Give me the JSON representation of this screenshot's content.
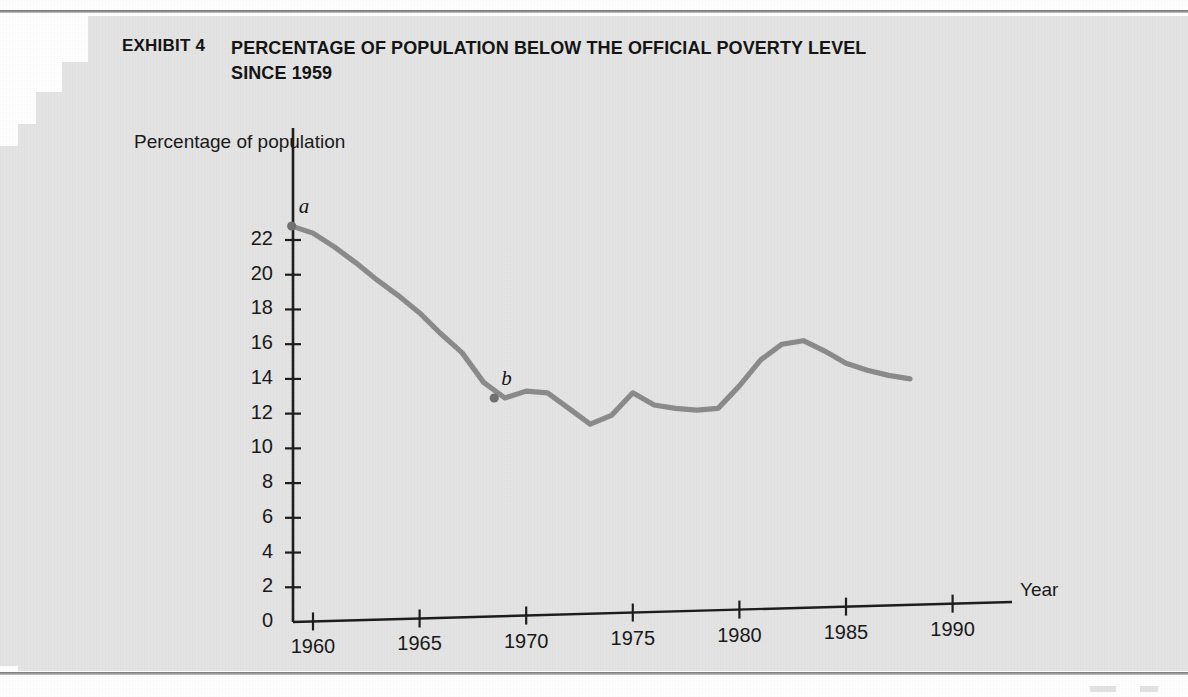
{
  "document": {
    "exhibit_label": "EXHIBIT 4",
    "title": "PERCENTAGE OF POPULATION BELOW THE OFFICIAL POVERTY LEVEL SINCE 1959"
  },
  "colors": {
    "paper": "#e4e4e4",
    "ink": "#111111",
    "axis": "#1a1a1a",
    "series_line": "#8a8a8a",
    "marker": "#6f6f6f"
  },
  "chart_data": {
    "type": "line",
    "title": "PERCENTAGE OF POPULATION BELOW THE OFFICIAL POVERTY LEVEL SINCE 1959",
    "xlabel": "Year",
    "ylabel": "Percentage of population",
    "xlim": [
      1958,
      1992
    ],
    "ylim": [
      0,
      23.5
    ],
    "grid": false,
    "legend": null,
    "xticks": [
      1960,
      1965,
      1970,
      1975,
      1980,
      1985,
      1990
    ],
    "yticks": [
      0,
      2,
      4,
      6,
      8,
      10,
      12,
      14,
      16,
      18,
      20,
      22
    ],
    "series": [
      {
        "name": "Percentage of population below official poverty level",
        "x": [
          1959,
          1960,
          1961,
          1962,
          1963,
          1964,
          1965,
          1966,
          1967,
          1968,
          1969,
          1970,
          1971,
          1972,
          1973,
          1974,
          1975,
          1976,
          1977,
          1978,
          1979,
          1980,
          1981,
          1982,
          1983,
          1984,
          1985,
          1986,
          1987,
          1988
        ],
        "values": [
          22.8,
          22.4,
          21.6,
          20.7,
          19.7,
          18.8,
          17.8,
          16.6,
          15.5,
          13.8,
          12.9,
          13.3,
          13.2,
          12.3,
          11.4,
          11.9,
          13.2,
          12.5,
          12.3,
          12.2,
          12.3,
          13.6,
          15.1,
          16.0,
          16.2,
          15.6,
          14.9,
          14.5,
          14.2,
          14.0
        ]
      }
    ],
    "annotations": [
      {
        "label": "a",
        "x": 1959,
        "y": 22.8,
        "marker": true
      },
      {
        "label": "b",
        "x": 1968.5,
        "y": 12.9,
        "marker": true
      }
    ]
  }
}
